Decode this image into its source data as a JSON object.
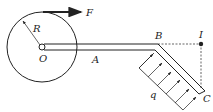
{
  "diagram": {
    "labels": {
      "force": "F",
      "radius": "R",
      "center": "O",
      "point_a": "A",
      "point_b": "B",
      "point_i": "I",
      "point_c": "C",
      "load": "q"
    },
    "colors": {
      "stroke": "#222222",
      "background": "#ffffff"
    }
  }
}
